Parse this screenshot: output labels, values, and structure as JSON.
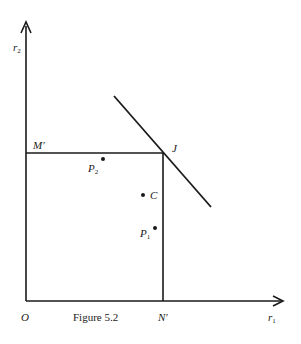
{
  "figure": {
    "caption": "Figure 5.2",
    "axes": {
      "y_label_main": "r",
      "y_label_sub": "2",
      "x_label_main": "r",
      "x_label_sub": "1",
      "origin_label": "O"
    },
    "points": {
      "M_prime": "M′",
      "N_prime": "N′",
      "J": "J",
      "C": "C",
      "P1_main": "P",
      "P1_sub": "1",
      "P2_main": "P",
      "P2_sub": "2"
    },
    "colors": {
      "ink": "#1a1a1a",
      "background": "#ffffff"
    }
  }
}
